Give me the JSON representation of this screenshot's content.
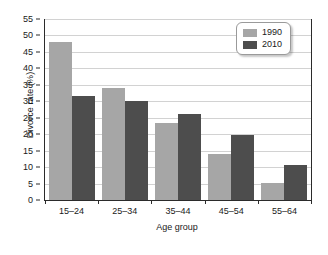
{
  "chart_data": {
    "type": "bar",
    "title": "",
    "xlabel": "Age group",
    "ylabel": "Divorce rate (%)",
    "categories": [
      "15–24",
      "25–34",
      "35–44",
      "45–54",
      "55–64"
    ],
    "series": [
      {
        "name": "1990",
        "color": "#a6a6a6",
        "values": [
          48.0,
          34.0,
          23.5,
          14.0,
          5.2
        ]
      },
      {
        "name": "2010",
        "color": "#4d4d4d",
        "values": [
          31.5,
          30.0,
          26.0,
          19.7,
          10.7
        ]
      }
    ],
    "ylim": [
      0,
      55
    ],
    "yticks": [
      0,
      5,
      10,
      15,
      20,
      25,
      30,
      35,
      40,
      45,
      50,
      55
    ],
    "ytick_labels": [
      "0",
      "5",
      "10",
      "15",
      "20",
      "25",
      "30",
      "35",
      "40",
      "45",
      "50",
      "55"
    ],
    "grid": true,
    "grid_axis": "y",
    "legend_position": "top-right",
    "legend_entries": [
      "1990",
      "2010"
    ]
  }
}
